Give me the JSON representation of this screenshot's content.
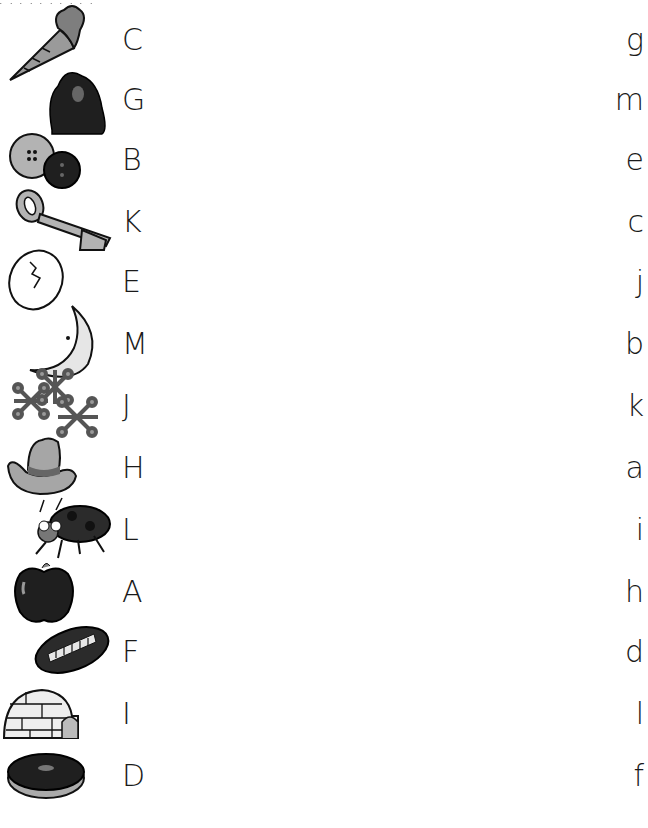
{
  "worksheet": {
    "type": "letter matching (uppercase to lowercase)",
    "rows": [
      {
        "picture": "carrot",
        "uppercase": "C",
        "lowercase": "g"
      },
      {
        "picture": "gorilla",
        "uppercase": "G",
        "lowercase": "m"
      },
      {
        "picture": "buttons",
        "uppercase": "B",
        "lowercase": "e"
      },
      {
        "picture": "key",
        "uppercase": "K",
        "lowercase": "c"
      },
      {
        "picture": "egg",
        "uppercase": "E",
        "lowercase": "j"
      },
      {
        "picture": "moon",
        "uppercase": "M",
        "lowercase": "b"
      },
      {
        "picture": "jacks",
        "uppercase": "J",
        "lowercase": "k"
      },
      {
        "picture": "hat",
        "uppercase": "H",
        "lowercase": "a"
      },
      {
        "picture": "ladybug",
        "uppercase": "L",
        "lowercase": "i"
      },
      {
        "picture": "apple",
        "uppercase": "A",
        "lowercase": "h"
      },
      {
        "picture": "football",
        "uppercase": "F",
        "lowercase": "d"
      },
      {
        "picture": "igloo",
        "uppercase": "I",
        "lowercase": "l"
      },
      {
        "picture": "donut",
        "uppercase": "D",
        "lowercase": "f"
      }
    ]
  },
  "colors": {
    "ink": "#1a1a1a",
    "gray": "#9a9a9a",
    "dark": "#2b2b2b",
    "light": "#e6e6e6"
  }
}
